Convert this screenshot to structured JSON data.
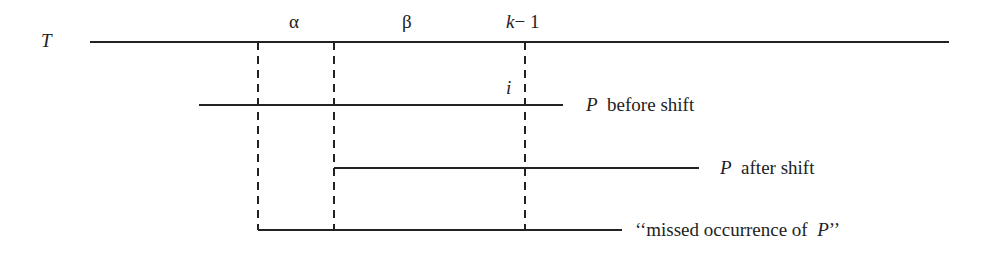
{
  "diagram": {
    "text_label": "T",
    "greek": {
      "alpha": "α",
      "beta": "β"
    },
    "index_k": "k",
    "index_minus_one": "− 1",
    "index_i": "i",
    "pattern_symbol": "P",
    "before_shift_text": "before shift",
    "after_shift_text": "after shift",
    "missed_open_quote": "‘‘missed occurrence of",
    "missed_close_quote": "’’",
    "line_color": "#222222"
  }
}
